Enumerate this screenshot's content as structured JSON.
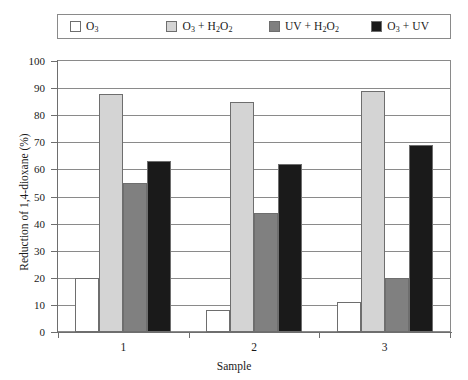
{
  "chart_data": {
    "type": "bar",
    "title": "",
    "xlabel": "Sample",
    "ylabel": "Reduction of 1,4-dioxane (%)",
    "categories": [
      "1",
      "2",
      "3"
    ],
    "ylim": [
      0,
      100
    ],
    "yticks": [
      0,
      10,
      20,
      30,
      40,
      50,
      60,
      70,
      80,
      90,
      100
    ],
    "grid": true,
    "legend_position": "top",
    "series": [
      {
        "name": "O3",
        "label_html": "O<sub>3</sub>",
        "color": "#ffffff",
        "values": [
          20,
          8,
          11
        ]
      },
      {
        "name": "O3 + H2O2",
        "label_html": "O<sub>3</sub> + H<sub>2</sub>O<sub>2</sub>",
        "color": "#d4d4d4",
        "values": [
          88,
          85,
          89
        ]
      },
      {
        "name": "UV + H2O2",
        "label_html": "UV + H<sub>2</sub>O<sub>2</sub>",
        "color": "#808080",
        "values": [
          55,
          44,
          20
        ]
      },
      {
        "name": "O3 + UV",
        "label_html": "O<sub>3</sub> + UV",
        "color": "#1a1a1a",
        "values": [
          63,
          62,
          69
        ]
      }
    ]
  },
  "legend": {
    "items": [
      {
        "label": "O3",
        "label_html": "O<sub>3</sub>",
        "color": "#ffffff"
      },
      {
        "label": "O3 + H2O2",
        "label_html": "O<sub>3</sub> + H<sub>2</sub>O<sub>2</sub>",
        "color": "#d4d4d4"
      },
      {
        "label": "UV + H2O2",
        "label_html": "UV + H<sub>2</sub>O<sub>2</sub>",
        "color": "#808080"
      },
      {
        "label": "O3 + UV",
        "label_html": "O<sub>3</sub> + UV",
        "color": "#1a1a1a"
      }
    ]
  },
  "axes": {
    "y_title": "Reduction of 1,4-dioxane (%)",
    "x_title": "Sample",
    "y_labels": [
      "100",
      "90",
      "80",
      "70",
      "60",
      "50",
      "40",
      "30",
      "20",
      "10",
      "0"
    ],
    "x_labels": [
      "1",
      "2",
      "3"
    ]
  },
  "colors": {
    "frame": "#8a8a8a",
    "axis": "#6e6e6e",
    "bar_outline": "#6e6e6e",
    "background": "#ffffff"
  }
}
